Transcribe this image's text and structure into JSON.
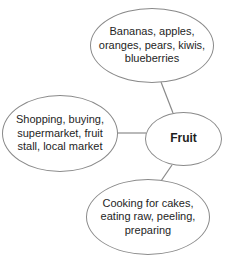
{
  "diagram": {
    "type": "mind-map",
    "center": {
      "label": "Fruit"
    },
    "nodes": [
      {
        "id": "types",
        "label": "Bananas, apples, oranges, pears, kiwis, blueberries"
      },
      {
        "id": "buying",
        "label": "Shopping, buying, supermarket, fruit stall, local market"
      },
      {
        "id": "uses",
        "label": "Cooking for cakes, eating raw, peeling, preparing"
      }
    ],
    "colors": {
      "stroke": "#8a8a8a",
      "text": "#1e1e1e",
      "background": "#ffffff"
    }
  }
}
